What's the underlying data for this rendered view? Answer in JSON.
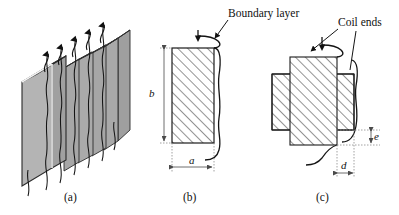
{
  "figure": {
    "type": "technical-line-diagram",
    "background_color": "#ffffff",
    "ink_color": "#111111",
    "block_fill_color": "#a8a8a8",
    "block_edge_highlight_color": "#e8e8e8",
    "hatch_color": "#333333",
    "dimension_line_color": "#999999",
    "panels": [
      {
        "id": "a",
        "caption": "(a)",
        "description": "isometric stack of rectangular coil blocks with wavy lead wires"
      },
      {
        "id": "b",
        "caption": "(b)",
        "description": "front elevation of single hatched coil with boundary layer"
      },
      {
        "id": "c",
        "caption": "(c)",
        "description": "plan view of crossed hatched coil with coil ends"
      }
    ]
  },
  "callouts": {
    "boundary_layer": "Boundary layer",
    "coil_ends": "Coil ends"
  },
  "dimensions": {
    "height_b": "b",
    "width_a": "a",
    "depth_d": "d",
    "gap_e": "e"
  },
  "captions": {
    "panel_a": "(a)",
    "panel_b": "(b)",
    "panel_c": "(c)"
  },
  "icons": {
    "flow_arrow": "flow-arrow-icon",
    "leader_line": "leader-line-icon",
    "dimension_arrow": "dimension-arrow-icon"
  }
}
